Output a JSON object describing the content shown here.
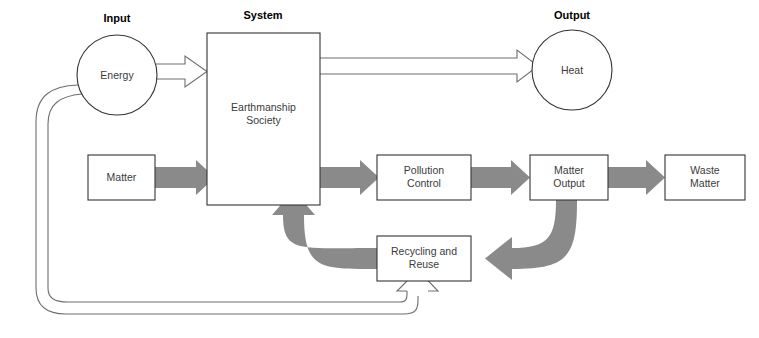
{
  "diagram": {
    "type": "systems-flow-diagram",
    "canvas": {
      "width": 759,
      "height": 338,
      "background": "#ffffff"
    }
  },
  "colors": {
    "matter_flow": "#8a8a8a",
    "energy_flow_stroke": "#6e6e6e",
    "box_stroke": "#333333",
    "box_fill": "#ffffff",
    "label_text": "#3b3b3b",
    "header_text": "#000000"
  },
  "headers": [
    {
      "id": "input",
      "label": "Input",
      "x": 117,
      "y": 12
    },
    {
      "id": "system",
      "label": "System",
      "x": 263,
      "y": 9
    },
    {
      "id": "output",
      "label": "Output",
      "x": 572,
      "y": 9
    }
  ],
  "nodes": {
    "energy": {
      "label": "Energy",
      "shape": "circle",
      "cx": 117,
      "cy": 75,
      "r": 40,
      "label_x": 117,
      "label_y": 69
    },
    "heat": {
      "label": "Heat",
      "shape": "circle",
      "cx": 572,
      "cy": 70,
      "r": 40,
      "label_x": 572,
      "label_y": 64
    },
    "system": {
      "label": "Earthmanship\nSociety",
      "shape": "rect",
      "x": 207,
      "y": 33,
      "w": 113,
      "h": 172,
      "label_x": 207,
      "label_y": 101,
      "label_w": 113
    },
    "matter": {
      "label": "Matter",
      "shape": "rect",
      "x": 88,
      "y": 155,
      "w": 67,
      "h": 45,
      "label_x": 88,
      "label_y": 171,
      "label_w": 67
    },
    "pollution_control": {
      "label": "Pollution\nControl",
      "shape": "rect",
      "x": 377,
      "y": 155,
      "w": 94,
      "h": 45,
      "label_x": 377,
      "label_y": 164,
      "label_w": 94
    },
    "matter_output": {
      "label": "Matter\nOutput",
      "shape": "rect",
      "x": 530,
      "y": 155,
      "w": 78,
      "h": 45,
      "label_x": 530,
      "label_y": 164,
      "label_w": 78
    },
    "waste_matter": {
      "label": "Waste\nMatter",
      "shape": "rect",
      "x": 665,
      "y": 155,
      "w": 80,
      "h": 45,
      "label_x": 665,
      "label_y": 164,
      "label_w": 80
    },
    "recycling_reuse": {
      "label": "Recycling and\nReuse",
      "shape": "rect",
      "x": 377,
      "y": 236,
      "w": 94,
      "h": 45,
      "label_x": 377,
      "label_y": 245,
      "label_w": 94
    }
  },
  "flows": [
    {
      "id": "energy-to-system",
      "kind": "energy",
      "from": "energy",
      "to": "system"
    },
    {
      "id": "system-to-heat",
      "kind": "energy",
      "from": "system",
      "to": "heat"
    },
    {
      "id": "energy-feedback-outer",
      "kind": "energy",
      "from": "energy",
      "to": "recycling_reuse"
    },
    {
      "id": "energy-feedback-inner",
      "kind": "energy",
      "from": "energy",
      "to": "recycling_reuse"
    },
    {
      "id": "matter-to-system",
      "kind": "matter",
      "from": "matter",
      "to": "system"
    },
    {
      "id": "system-to-pollution-control",
      "kind": "matter",
      "from": "system",
      "to": "pollution_control"
    },
    {
      "id": "pollution-control-to-matter-output",
      "kind": "matter",
      "from": "pollution_control",
      "to": "matter_output"
    },
    {
      "id": "matter-output-to-waste-matter",
      "kind": "matter",
      "from": "matter_output",
      "to": "waste_matter"
    },
    {
      "id": "matter-output-to-recycling",
      "kind": "matter",
      "from": "matter_output",
      "to": "recycling_reuse"
    },
    {
      "id": "recycling-to-system",
      "kind": "matter",
      "from": "recycling_reuse",
      "to": "system"
    }
  ]
}
